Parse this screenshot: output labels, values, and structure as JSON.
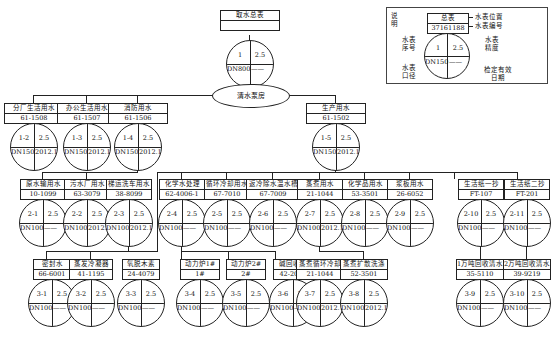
{
  "diagram": {
    "title_node": {
      "name": "取水总表",
      "code": "",
      "meter": {
        "seq": "1",
        "rating": "2.5",
        "size": "DN800",
        "date": "——"
      }
    },
    "pump_house": "清水泵房",
    "level1": [
      {
        "name": "分厂生活用水",
        "code": "61-1508",
        "meter": {
          "seq": "1-2",
          "rating": "2.5",
          "size": "DN150",
          "date": "2012.10.25"
        }
      },
      {
        "name": "办公生活用水",
        "code": "61-1507",
        "meter": {
          "seq": "1-3",
          "rating": "2.5",
          "size": "DN150",
          "date": "2012.10.25"
        }
      },
      {
        "name": "消防用水",
        "code": "61-1506",
        "meter": {
          "seq": "1-4",
          "rating": "2.5",
          "size": "DN150",
          "date": "2012.10.25"
        }
      },
      {
        "name": "生产用水",
        "code": "61-1502",
        "meter": {
          "seq": "1-5",
          "rating": "2.5",
          "size": "DN150",
          "date": "2012.10.25"
        }
      }
    ],
    "level2": [
      {
        "name": "原水输用水",
        "code": "10-1099",
        "meter": {
          "seq": "2-1",
          "rating": "2.5",
          "size": "DN100",
          "date": "——"
        }
      },
      {
        "name": "污水厂用水",
        "code": "63-3079",
        "meter": {
          "seq": "2-2",
          "rating": "2.5",
          "size": "DN100",
          "date": "2012.10.21"
        }
      },
      {
        "name": "梯运洗车用水",
        "code": "38-8099",
        "meter": {
          "seq": "2-3",
          "rating": "2.5",
          "size": "DN100",
          "date": "2012.10.21"
        }
      },
      {
        "name": "化学水处理",
        "code": "62-4006-1",
        "meter": {
          "seq": "2-4",
          "rating": "2.5",
          "size": "DN100",
          "date": "——"
        }
      },
      {
        "name": "循环冷却用水",
        "code": "67-7010",
        "meter": {
          "seq": "2-5",
          "rating": "2.5",
          "size": "DN100",
          "date": "——"
        }
      },
      {
        "name": "返冷除水温水槽",
        "code": "67-7009",
        "meter": {
          "seq": "2-6",
          "rating": "2.5",
          "size": "DN100",
          "date": "——"
        }
      },
      {
        "name": "蒸煮用水",
        "code": "21-1044",
        "meter": {
          "seq": "2-7",
          "rating": "2.5",
          "size": "DN100",
          "date": "2012.10.21"
        }
      },
      {
        "name": "化学品用水",
        "code": "53-3501",
        "meter": {
          "seq": "2-8",
          "rating": "2.5",
          "size": "DN100",
          "date": "——"
        }
      },
      {
        "name": "浆板用水",
        "code": "26-6052",
        "meter": {
          "seq": "2-9",
          "rating": "2.5",
          "size": "DN100",
          "date": "——"
        }
      },
      {
        "name": "生活纸一抄",
        "code": "FT-107",
        "meter": {
          "seq": "2-10",
          "rating": "2.5",
          "size": "DN100",
          "date": "——"
        }
      },
      {
        "name": "生活纸二抄",
        "code": "FT-201",
        "meter": {
          "seq": "2-11",
          "rating": "2.5",
          "size": "DN100",
          "date": "——"
        }
      }
    ],
    "level3": [
      {
        "name": "密封水",
        "code": "66-6001",
        "meter": {
          "seq": "3-1",
          "rating": "2.5",
          "size": "DN100",
          "date": "——"
        }
      },
      {
        "name": "蒸发冷凝器",
        "code": "41-1195",
        "meter": {
          "seq": "3-2",
          "rating": "2.5",
          "size": "DN100",
          "date": "——"
        }
      },
      {
        "name": "氧脱木素",
        "code": "24-4079",
        "meter": {
          "seq": "3-3",
          "rating": "2.5",
          "size": "DN100",
          "date": "——"
        }
      },
      {
        "name": "动力炉1#",
        "code": "1#",
        "meter": {
          "seq": "3-4",
          "rating": "2.5",
          "size": "DN100",
          "date": "——"
        }
      },
      {
        "name": "动力炉2#",
        "code": "2#",
        "meter": {
          "seq": "3-5",
          "rating": "2.5",
          "size": "DN100",
          "date": "——"
        }
      },
      {
        "name": "碱回收炉",
        "code": "42-2002",
        "meter": {
          "seq": "3-6",
          "rating": "2.5",
          "size": "DN100",
          "date": "——"
        }
      },
      {
        "name": "蒸煮循环冷却",
        "code": "21-1044",
        "meter": {
          "seq": "3-7",
          "rating": "2.5",
          "size": "DN100",
          "date": "2012.10.26"
        }
      },
      {
        "name": "蒸煮扩散洗涤",
        "code": "52-3501",
        "meter": {
          "seq": "3-8",
          "rating": "2.5",
          "size": "DN100",
          "date": "2012.10.26"
        }
      },
      {
        "name": "1万吨回收清水",
        "code": "35-5110",
        "meter": {
          "seq": "3-9",
          "rating": "2.5",
          "size": "DN100",
          "date": "——"
        }
      },
      {
        "name": "2万吨回收清水",
        "code": "39-9219",
        "meter": {
          "seq": "3-10",
          "rating": "2.5",
          "size": "DN100",
          "date": "——"
        }
      }
    ]
  },
  "legend": {
    "title": "说明",
    "sample": {
      "name": "总表",
      "code": "37161188",
      "meter": {
        "seq": "1",
        "rating": "2.5",
        "size": "DN150",
        "date": "——"
      }
    },
    "annotations": {
      "location": "水表位置",
      "number": "水表编号",
      "accuracy": "水表精度",
      "seq": "水表序号",
      "size": "水表口径",
      "verify_date": "检定有效日期"
    }
  }
}
